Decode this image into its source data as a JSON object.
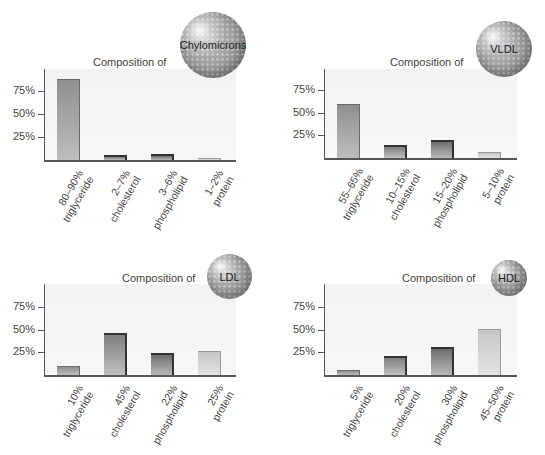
{
  "colors": {
    "plot_background": "#f4f4f4",
    "axis": "#555555",
    "triglyceride": "#a5a5a5",
    "cholesterol": "#9a9a9a",
    "phospholipid": "#8e8e8e",
    "protein": "#d5d5d5"
  },
  "panels": [
    {
      "title": "Composition of",
      "particle": "Chylomicrons",
      "y_ticks": [
        "75%",
        "50%",
        "25%"
      ],
      "bars": [
        {
          "range": "80–90%",
          "component": "triglyceride",
          "value": 88
        },
        {
          "range": "2–7%",
          "component": "cholesterol",
          "value": 5
        },
        {
          "range": "3–6%",
          "component": "phospholipid",
          "value": 7
        },
        {
          "range": "1–2%",
          "component": "protein",
          "value": 2
        }
      ]
    },
    {
      "title": "Composition of",
      "particle": "VLDL",
      "y_ticks": [
        "75%",
        "50%",
        "25%"
      ],
      "bars": [
        {
          "range": "55–65%",
          "component": "triglyceride",
          "value": 59
        },
        {
          "range": "10–15%",
          "component": "cholesterol",
          "value": 14
        },
        {
          "range": "15–20%",
          "component": "phospholipid",
          "value": 20
        },
        {
          "range": "5–10%",
          "component": "protein",
          "value": 7
        }
      ]
    },
    {
      "title": "Composition of",
      "particle": "LDL",
      "y_ticks": [
        "75%",
        "50%",
        "25%"
      ],
      "bars": [
        {
          "range": "10%",
          "component": "triglyceride",
          "value": 10
        },
        {
          "range": "45%",
          "component": "cholesterol",
          "value": 46
        },
        {
          "range": "22%",
          "component": "phospholipid",
          "value": 24
        },
        {
          "range": "25%",
          "component": "protein",
          "value": 26
        }
      ]
    },
    {
      "title": "Composition of",
      "particle": "HDL",
      "y_ticks": [
        "75%",
        "50%",
        "25%"
      ],
      "bars": [
        {
          "range": "5%",
          "component": "triglyceride",
          "value": 5
        },
        {
          "range": "20%",
          "component": "cholesterol",
          "value": 21
        },
        {
          "range": "30%",
          "component": "phospholipid",
          "value": 31
        },
        {
          "range": "45–50%",
          "component": "protein",
          "value": 51
        }
      ]
    }
  ],
  "chart_data": [
    {
      "type": "bar",
      "title": "Composition of Chylomicrons",
      "categories": [
        "80–90% triglyceride",
        "2–7% cholesterol",
        "3–6% phospholipid",
        "1–2% protein"
      ],
      "values": [
        88,
        5,
        7,
        2
      ],
      "xlabel": "",
      "ylabel": "",
      "yticks": [
        "25%",
        "50%",
        "75%"
      ],
      "ylim": [
        0,
        100
      ],
      "grid": false,
      "legend": "none"
    },
    {
      "type": "bar",
      "title": "Composition of VLDL",
      "categories": [
        "55–65% triglyceride",
        "10–15% cholesterol",
        "15–20% phospholipid",
        "5–10% protein"
      ],
      "values": [
        59,
        14,
        20,
        7
      ],
      "xlabel": "",
      "ylabel": "",
      "yticks": [
        "25%",
        "50%",
        "75%"
      ],
      "ylim": [
        0,
        100
      ],
      "grid": false,
      "legend": "none"
    },
    {
      "type": "bar",
      "title": "Composition of LDL",
      "categories": [
        "10% triglyceride",
        "45% cholesterol",
        "22% phospholipid",
        "25% protein"
      ],
      "values": [
        10,
        46,
        24,
        26
      ],
      "xlabel": "",
      "ylabel": "",
      "yticks": [
        "25%",
        "50%",
        "75%"
      ],
      "ylim": [
        0,
        100
      ],
      "grid": false,
      "legend": "none"
    },
    {
      "type": "bar",
      "title": "Composition of HDL",
      "categories": [
        "5% triglyceride",
        "20% cholesterol",
        "30% phospholipid",
        "45–50% protein"
      ],
      "values": [
        5,
        21,
        31,
        51
      ],
      "xlabel": "",
      "ylabel": "",
      "yticks": [
        "25%",
        "50%",
        "75%"
      ],
      "ylim": [
        0,
        100
      ],
      "grid": false,
      "legend": "none"
    }
  ]
}
